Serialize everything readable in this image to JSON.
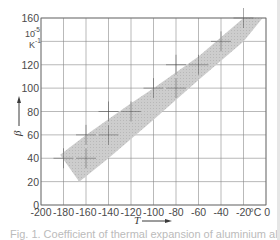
{
  "chart_data": {
    "type": "area",
    "title": "",
    "xlabel": "T",
    "xunit": "°C",
    "ylabel": "β",
    "yunit": "10⁻⁵ K⁻¹",
    "xlim": [
      -200,
      0
    ],
    "ylim": [
      0,
      160
    ],
    "grid": true,
    "x_ticks": [
      -200,
      -180,
      -160,
      -140,
      -120,
      -100,
      -80,
      -60,
      -40,
      -20,
      0
    ],
    "x_tick_labels": [
      "-200",
      "-180",
      "-160",
      "-140",
      "-120",
      "-100",
      "-80",
      "-60",
      "-40",
      "-20",
      "°C 0"
    ],
    "y_ticks": [
      0,
      20,
      40,
      60,
      80,
      100,
      120,
      160
    ],
    "y_tick_labels": [
      "0",
      "20",
      "40",
      "60",
      "80",
      "100",
      "120",
      "160"
    ],
    "y_unit_lines": [
      "10",
      "-5",
      "K",
      "-1"
    ],
    "band": {
      "description": "Shaded scatter band of coefficient of thermal expansion β versus temperature T",
      "upper_edge": [
        {
          "x": -183,
          "y": 43
        },
        {
          "x": -160,
          "y": 60
        },
        {
          "x": -120,
          "y": 87
        },
        {
          "x": -100,
          "y": 100
        },
        {
          "x": -60,
          "y": 127
        },
        {
          "x": -20,
          "y": 160
        }
      ],
      "lower_edge": [
        {
          "x": -166,
          "y": 20
        },
        {
          "x": -140,
          "y": 40
        },
        {
          "x": -100,
          "y": 73
        },
        {
          "x": -60,
          "y": 107
        },
        {
          "x": -20,
          "y": 140
        },
        {
          "x": -3,
          "y": 160
        }
      ],
      "fill": "#c8c8c8"
    },
    "highlighted_points": [
      {
        "x": -180,
        "y": 40
      },
      {
        "x": -160,
        "y": 40
      },
      {
        "x": -160,
        "y": 60
      },
      {
        "x": -140,
        "y": 60
      },
      {
        "x": -140,
        "y": 80
      },
      {
        "x": -120,
        "y": 80
      },
      {
        "x": -100,
        "y": 100
      },
      {
        "x": -80,
        "y": 100
      },
      {
        "x": -80,
        "y": 120
      },
      {
        "x": -60,
        "y": 120
      },
      {
        "x": -40,
        "y": 140
      },
      {
        "x": -20,
        "y": 160
      }
    ]
  },
  "labels": {
    "xlabel": "T",
    "ylabel": "β",
    "xunit_tick": "°C 0",
    "yunit_base": "10",
    "yunit_exp": "-5",
    "yunit_k": "K",
    "yunit_kexp": "-1"
  },
  "caption": "Fig. 1. Coefficient of thermal expansion of aluminium alloys",
  "colors": {
    "grid": "#8a8a8a",
    "grid_strong": "#3a3a3a",
    "band": "#c8c8c8",
    "text": "#4a4a4a"
  }
}
